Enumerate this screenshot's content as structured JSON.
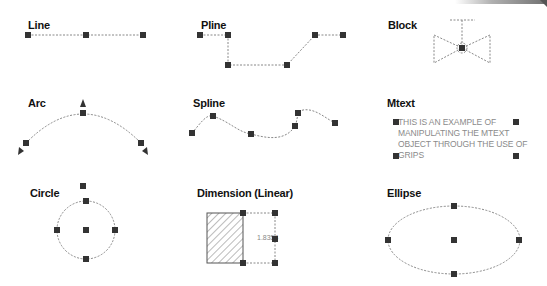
{
  "panels": [
    {
      "id": "line",
      "label": "Line"
    },
    {
      "id": "pline",
      "label": "Pline"
    },
    {
      "id": "block",
      "label": "Block"
    },
    {
      "id": "arc",
      "label": "Arc"
    },
    {
      "id": "spline",
      "label": "Spline"
    },
    {
      "id": "mtext",
      "label": "Mtext",
      "content": "THIS IS AN EXAMPLE OF MANIPULATING THE MTEXT OBJECT THROUGH THE USE OF GRIPS"
    },
    {
      "id": "circle",
      "label": "Circle"
    },
    {
      "id": "dimension",
      "label": "Dimension (Linear)",
      "value": "1.8354"
    },
    {
      "id": "ellipse",
      "label": "Ellipse"
    }
  ],
  "colors": {
    "grip": "#333333",
    "dashed_line": "#888888",
    "text": "#111111",
    "mtext": "#8a8a8a"
  }
}
